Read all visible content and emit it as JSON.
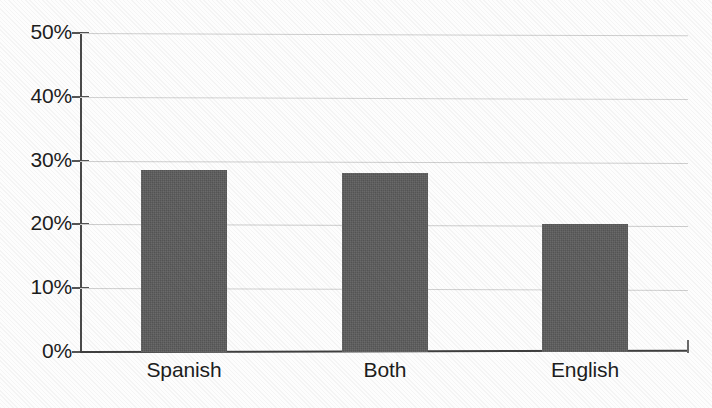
{
  "chart_data": {
    "type": "bar",
    "title": "",
    "subtitle": "",
    "xlabel": "",
    "ylabel": "",
    "categories": [
      "Spanish",
      "Both",
      "English"
    ],
    "values": [
      28.5,
      28.0,
      20.0
    ],
    "value_labels": [
      "28.5%",
      "28%",
      "20%"
    ],
    "ylim": [
      0,
      50
    ],
    "y_ticks": [
      0,
      10,
      20,
      30,
      40,
      50
    ],
    "y_tick_labels": [
      "0%",
      "10%",
      "20%",
      "30%",
      "40%",
      "50%"
    ],
    "grid": true,
    "grid_axis": "y",
    "legend": false,
    "legend_position": "none",
    "bar_color": "#5b5b5b",
    "gridline_color": "#cfcfcf",
    "axis_color": "#3f3f3f",
    "background_color": "#fdfdfd",
    "series": [
      {
        "name": "Share",
        "values": [
          28.5,
          28.0,
          20.0
        ]
      }
    ]
  },
  "axes": {
    "y_labels": {
      "t50": "50%",
      "t40": "40%",
      "t30": "30%",
      "t20": "20%",
      "t10": "10%",
      "t0": "0%"
    },
    "x_labels": {
      "c0": "Spanish",
      "c1": "Both",
      "c2": "English"
    }
  }
}
